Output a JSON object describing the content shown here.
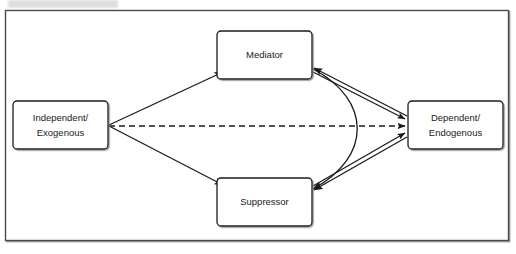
{
  "figure": {
    "title_redacted": true,
    "border_color": "#4a4a4a",
    "background_color": "#ffffff",
    "line_color": "#1a1a1a"
  },
  "nodes": [
    {
      "id": "independent",
      "name": "independent-exogenous-node",
      "line1": "Independent/",
      "line2": "Exogenous",
      "x": 13,
      "y": 101,
      "w": 95,
      "h": 48
    },
    {
      "id": "mediator",
      "name": "mediator-node",
      "line1": "Mediator",
      "line2": "",
      "x": 217,
      "y": 31,
      "w": 95,
      "h": 48
    },
    {
      "id": "suppressor",
      "name": "suppressor-node",
      "line1": "Suppressor",
      "line2": "",
      "x": 217,
      "y": 178,
      "w": 95,
      "h": 48
    },
    {
      "id": "dependent",
      "name": "dependent-endogenous-node",
      "line1": "Dependent/",
      "line2": "Endogenous",
      "x": 408,
      "y": 101,
      "w": 95,
      "h": 48
    }
  ],
  "edges": [
    {
      "id": "ind-to-med",
      "name": "edge-independent-to-mediator",
      "from": "independent",
      "to": "mediator",
      "style": "solid",
      "arrow": "end",
      "label": ""
    },
    {
      "id": "ind-to-sup",
      "name": "edge-independent-to-suppressor",
      "from": "independent",
      "to": "suppressor",
      "style": "solid",
      "arrow": "end",
      "label": ""
    },
    {
      "id": "ind-to-dep",
      "name": "edge-independent-to-dependent-direct",
      "from": "independent",
      "to": "dependent",
      "style": "dashed",
      "arrow": "end",
      "label": ""
    },
    {
      "id": "med-to-dep",
      "name": "edge-mediator-to-dependent",
      "from": "mediator",
      "to": "dependent",
      "style": "solid",
      "arrow": "end",
      "label": ""
    },
    {
      "id": "sup-to-dep",
      "name": "edge-suppressor-to-dependent",
      "from": "suppressor",
      "to": "dependent",
      "style": "solid",
      "arrow": "end",
      "label": ""
    },
    {
      "id": "dep-to-med",
      "name": "edge-dependent-to-mediator",
      "from": "dependent",
      "to": "mediator",
      "style": "solid",
      "arrow": "end",
      "label": ""
    },
    {
      "id": "dep-to-sup",
      "name": "edge-dependent-to-suppressor",
      "from": "dependent",
      "to": "suppressor",
      "style": "solid",
      "arrow": "end",
      "label": ""
    },
    {
      "id": "med-sup-curve",
      "name": "edge-mediator-suppressor-curve",
      "from": "mediator",
      "to": "suppressor",
      "style": "solid-curved",
      "arrow": "both",
      "label": ""
    }
  ]
}
